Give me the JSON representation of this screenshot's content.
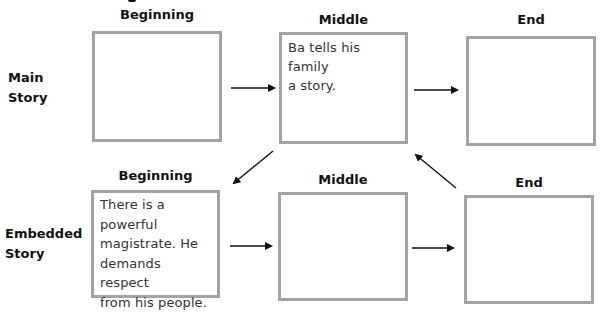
{
  "diagram": {
    "type": "story-map",
    "columns": [
      "Beginning",
      "Middle",
      "End"
    ],
    "rows": [
      {
        "label_line1": "Main",
        "label_line2": "Story",
        "headers": {
          "beginning": "Beginning",
          "middle": "Middle",
          "end": "End"
        },
        "boxes": {
          "beginning": "",
          "middle": "Ba tells his family\na story.",
          "end": ""
        }
      },
      {
        "label_line1": "Embedded",
        "label_line2": "Story",
        "headers": {
          "beginning": "Beginning",
          "middle": "Middle",
          "end": "End"
        },
        "boxes": {
          "beginning": "There is a\npowerful\nmagistrate. He\ndemands respect\nfrom his people.",
          "middle": "",
          "end": ""
        }
      }
    ],
    "arrows": [
      {
        "from": "main.beginning",
        "to": "main.middle",
        "direction": "right"
      },
      {
        "from": "main.middle",
        "to": "main.end",
        "direction": "right"
      },
      {
        "from": "main.middle",
        "to": "embedded.beginning",
        "direction": "down-left"
      },
      {
        "from": "embedded.beginning",
        "to": "embedded.middle",
        "direction": "right"
      },
      {
        "from": "embedded.middle",
        "to": "embedded.end",
        "direction": "right"
      },
      {
        "from": "embedded.end",
        "to": "main.middle",
        "direction": "up-left"
      }
    ],
    "colors": {
      "box_border": "#a3a3a3",
      "arrow": "#111111",
      "text": "#333333"
    }
  }
}
